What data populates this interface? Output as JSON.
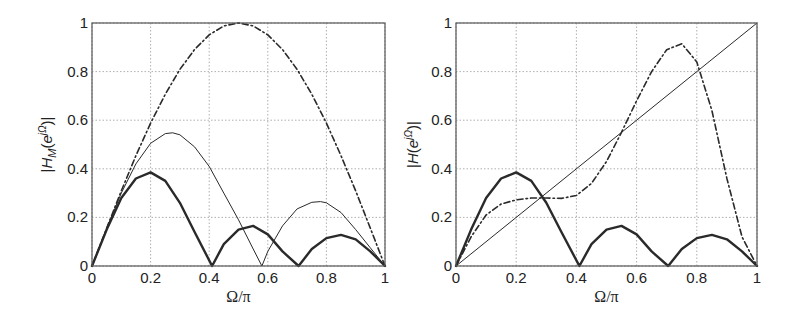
{
  "chart_data": [
    {
      "type": "line",
      "panel": "left",
      "title": "",
      "xlabel": "Ω/π",
      "ylabel": "|H_M(e^{jΩ})|",
      "xlim": [
        0,
        1
      ],
      "ylim": [
        0,
        1
      ],
      "xticks": [
        "0",
        "0.2",
        "0.4",
        "0.6",
        "0.8",
        "1"
      ],
      "yticks": [
        "0",
        "0.2",
        "0.4",
        "0.6",
        "0.8",
        "1"
      ],
      "grid": true,
      "legend": null,
      "series": [
        {
          "name": "dash-dot envelope",
          "style": "dashdot",
          "width": 1.6,
          "x": [
            0,
            0.05,
            0.1,
            0.15,
            0.2,
            0.25,
            0.3,
            0.35,
            0.4,
            0.45,
            0.5,
            0.55,
            0.6,
            0.65,
            0.7,
            0.75,
            0.8,
            0.85,
            0.9,
            0.95,
            1.0
          ],
          "y": [
            0,
            0.156,
            0.309,
            0.454,
            0.588,
            0.707,
            0.809,
            0.891,
            0.951,
            0.988,
            1.0,
            0.988,
            0.951,
            0.891,
            0.809,
            0.707,
            0.588,
            0.454,
            0.309,
            0.156,
            0
          ]
        },
        {
          "name": "thin solid",
          "style": "solid",
          "width": 1.0,
          "x": [
            0,
            0.05,
            0.1,
            0.15,
            0.2,
            0.25,
            0.275,
            0.3,
            0.35,
            0.4,
            0.45,
            0.5,
            0.55,
            0.58,
            0.6,
            0.65,
            0.7,
            0.75,
            0.78,
            0.8,
            0.85,
            0.9,
            0.95,
            1.0
          ],
          "y": [
            0,
            0.155,
            0.3,
            0.42,
            0.505,
            0.545,
            0.548,
            0.54,
            0.49,
            0.41,
            0.3,
            0.19,
            0.07,
            0,
            0.06,
            0.165,
            0.235,
            0.262,
            0.265,
            0.26,
            0.22,
            0.15,
            0.075,
            0
          ]
        },
        {
          "name": "thick solid",
          "style": "solid",
          "width": 2.4,
          "x": [
            0,
            0.05,
            0.1,
            0.15,
            0.2,
            0.25,
            0.3,
            0.35,
            0.41,
            0.45,
            0.5,
            0.55,
            0.6,
            0.65,
            0.705,
            0.75,
            0.8,
            0.85,
            0.9,
            0.95,
            1.0
          ],
          "y": [
            0,
            0.15,
            0.28,
            0.36,
            0.385,
            0.35,
            0.26,
            0.14,
            0,
            0.09,
            0.15,
            0.165,
            0.13,
            0.06,
            0,
            0.07,
            0.115,
            0.128,
            0.11,
            0.06,
            0
          ]
        }
      ]
    },
    {
      "type": "line",
      "panel": "right",
      "title": "",
      "xlabel": "Ω/π",
      "ylabel": "|H(e^{jΩ})|",
      "xlim": [
        0,
        1
      ],
      "ylim": [
        0,
        1
      ],
      "xticks": [
        "0",
        "0.2",
        "0.4",
        "0.6",
        "0.8",
        "1"
      ],
      "yticks": [
        "0",
        "0.2",
        "0.4",
        "0.6",
        "0.8",
        "1"
      ],
      "grid": true,
      "legend": null,
      "series": [
        {
          "name": "ideal linear",
          "style": "solid",
          "width": 1.0,
          "x": [
            0,
            1
          ],
          "y": [
            0,
            1
          ]
        },
        {
          "name": "dash-dot approximation",
          "style": "dashdot",
          "width": 1.6,
          "x": [
            0,
            0.05,
            0.1,
            0.15,
            0.2,
            0.25,
            0.3,
            0.35,
            0.4,
            0.45,
            0.5,
            0.55,
            0.6,
            0.65,
            0.7,
            0.75,
            0.8,
            0.85,
            0.9,
            0.95,
            1.0
          ],
          "y": [
            0,
            0.12,
            0.21,
            0.255,
            0.272,
            0.28,
            0.28,
            0.278,
            0.29,
            0.34,
            0.43,
            0.55,
            0.68,
            0.8,
            0.89,
            0.915,
            0.84,
            0.64,
            0.36,
            0.12,
            0
          ]
        },
        {
          "name": "thick solid",
          "style": "solid",
          "width": 2.4,
          "x": [
            0,
            0.05,
            0.1,
            0.15,
            0.2,
            0.25,
            0.3,
            0.35,
            0.41,
            0.45,
            0.5,
            0.55,
            0.6,
            0.65,
            0.705,
            0.75,
            0.8,
            0.85,
            0.9,
            0.95,
            1.0
          ],
          "y": [
            0,
            0.15,
            0.28,
            0.36,
            0.385,
            0.35,
            0.26,
            0.14,
            0,
            0.09,
            0.15,
            0.165,
            0.13,
            0.06,
            0,
            0.07,
            0.115,
            0.128,
            0.11,
            0.06,
            0
          ]
        }
      ]
    }
  ],
  "layout": {
    "panels": [
      {
        "x0": 92,
        "x1": 385,
        "y0": 266,
        "y1": 23,
        "ylabel_x": 52
      },
      {
        "x0": 456,
        "x1": 757,
        "y0": 266,
        "y1": 23,
        "ylabel_x": 418
      }
    ],
    "colors": {
      "line": "#2a2a2a",
      "axis": "#555555",
      "grid": "#9a9a9a"
    }
  }
}
